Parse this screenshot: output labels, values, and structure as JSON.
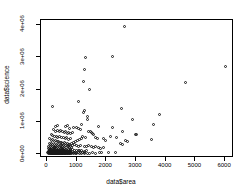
{
  "chart_data": {
    "type": "scatter",
    "title": "",
    "xlabel": "data$area",
    "ylabel": "data$science",
    "xlim": [
      -200,
      6300
    ],
    "ylim": [
      -120000,
      4150000
    ],
    "grid": false,
    "legend": null,
    "marker": "open-circle",
    "xticks": [
      0,
      1000,
      2000,
      3000,
      4000,
      5000,
      6000
    ],
    "xticklabels": [
      "0",
      "1000",
      "2000",
      "3000",
      "4000",
      "5000",
      "6000"
    ],
    "yticks": [
      0,
      1000000,
      2000000,
      3000000,
      4000000
    ],
    "yticklabels": [
      "0e+00",
      "1e+06",
      "2e+06",
      "3e+06",
      "4e+06"
    ],
    "n_points": 268,
    "points": [
      [
        2600,
        3950000
      ],
      [
        1300,
        3000000
      ],
      [
        2200,
        3020000
      ],
      [
        6000,
        2720000
      ],
      [
        1270,
        2620000
      ],
      [
        4680,
        2230000
      ],
      [
        1220,
        2240000
      ],
      [
        1450,
        2000000
      ],
      [
        1050,
        1620000
      ],
      [
        180,
        1470000
      ],
      [
        2520,
        1400000
      ],
      [
        3800,
        1220000
      ],
      [
        1280,
        1350000
      ],
      [
        1230,
        1300000
      ],
      [
        2890,
        1070000
      ],
      [
        1350,
        1150000
      ],
      [
        1360,
        1060000
      ],
      [
        3600,
        920000
      ],
      [
        1180,
        930000
      ],
      [
        1750,
        870000
      ],
      [
        300,
        860000
      ],
      [
        360,
        880000
      ],
      [
        620,
        840000
      ],
      [
        700,
        880000
      ],
      [
        2200,
        830000
      ],
      [
        760,
        800000
      ],
      [
        900,
        810000
      ],
      [
        980,
        830000
      ],
      [
        1050,
        790000
      ],
      [
        1120,
        760000
      ],
      [
        2540,
        700000
      ],
      [
        2990,
        610000
      ],
      [
        3020,
        620000
      ],
      [
        1400,
        700000
      ],
      [
        1460,
        690000
      ],
      [
        1500,
        670000
      ],
      [
        1540,
        640000
      ],
      [
        1580,
        600000
      ],
      [
        230,
        760000
      ],
      [
        280,
        700000
      ],
      [
        340,
        730000
      ],
      [
        420,
        700000
      ],
      [
        470,
        720000
      ],
      [
        520,
        690000
      ],
      [
        580,
        660000
      ],
      [
        640,
        690000
      ],
      [
        690,
        650000
      ],
      [
        740,
        670000
      ],
      [
        800,
        640000
      ],
      [
        850,
        660000
      ],
      [
        2130,
        560000
      ],
      [
        2340,
        520000
      ],
      [
        3530,
        440000
      ],
      [
        2650,
        430000
      ],
      [
        2720,
        400000
      ],
      [
        1900,
        470000
      ],
      [
        1980,
        430000
      ],
      [
        1700,
        480000
      ],
      [
        1620,
        500000
      ],
      [
        1300,
        520000
      ],
      [
        1210,
        540000
      ],
      [
        1150,
        480000
      ],
      [
        1080,
        450000
      ],
      [
        1020,
        410000
      ],
      [
        960,
        390000
      ],
      [
        890,
        360000
      ],
      [
        830,
        330000
      ],
      [
        770,
        300000
      ],
      [
        2470,
        330000
      ],
      [
        2560,
        300000
      ],
      [
        150,
        620000
      ],
      [
        200,
        580000
      ],
      [
        250,
        540000
      ],
      [
        310,
        560000
      ],
      [
        370,
        520000
      ],
      [
        430,
        540000
      ],
      [
        490,
        500000
      ],
      [
        550,
        520000
      ],
      [
        610,
        480000
      ],
      [
        670,
        500000
      ],
      [
        730,
        460000
      ],
      [
        790,
        470000
      ],
      [
        100,
        470000
      ],
      [
        140,
        430000
      ],
      [
        190,
        440000
      ],
      [
        240,
        400000
      ],
      [
        290,
        410000
      ],
      [
        340,
        380000
      ],
      [
        390,
        390000
      ],
      [
        440,
        360000
      ],
      [
        490,
        370000
      ],
      [
        540,
        340000
      ],
      [
        590,
        350000
      ],
      [
        640,
        320000
      ],
      [
        690,
        330000
      ],
      [
        740,
        300000
      ],
      [
        860,
        280000
      ],
      [
        920,
        300000
      ],
      [
        1000,
        270000
      ],
      [
        1070,
        250000
      ],
      [
        1140,
        280000
      ],
      [
        1250,
        250000
      ],
      [
        1330,
        230000
      ],
      [
        1410,
        260000
      ],
      [
        1490,
        230000
      ],
      [
        1570,
        200000
      ],
      [
        1650,
        230000
      ],
      [
        1730,
        200000
      ],
      [
        1810,
        180000
      ],
      [
        1890,
        210000
      ],
      [
        80,
        330000
      ],
      [
        120,
        300000
      ],
      [
        160,
        320000
      ],
      [
        200,
        290000
      ],
      [
        240,
        310000
      ],
      [
        280,
        280000
      ],
      [
        320,
        300000
      ],
      [
        360,
        270000
      ],
      [
        400,
        290000
      ],
      [
        440,
        260000
      ],
      [
        480,
        280000
      ],
      [
        520,
        250000
      ],
      [
        560,
        270000
      ],
      [
        600,
        240000
      ],
      [
        640,
        260000
      ],
      [
        680,
        230000
      ],
      [
        720,
        250000
      ],
      [
        760,
        220000
      ],
      [
        800,
        240000
      ],
      [
        840,
        210000
      ],
      [
        60,
        240000
      ],
      [
        90,
        220000
      ],
      [
        120,
        240000
      ],
      [
        150,
        210000
      ],
      [
        180,
        230000
      ],
      [
        210,
        200000
      ],
      [
        240,
        220000
      ],
      [
        270,
        190000
      ],
      [
        300,
        210000
      ],
      [
        330,
        180000
      ],
      [
        360,
        200000
      ],
      [
        390,
        170000
      ],
      [
        420,
        190000
      ],
      [
        450,
        160000
      ],
      [
        480,
        180000
      ],
      [
        510,
        150000
      ],
      [
        540,
        170000
      ],
      [
        570,
        140000
      ],
      [
        600,
        160000
      ],
      [
        630,
        130000
      ],
      [
        660,
        150000
      ],
      [
        690,
        120000
      ],
      [
        720,
        140000
      ],
      [
        750,
        120000
      ],
      [
        780,
        140000
      ],
      [
        810,
        110000
      ],
      [
        870,
        130000
      ],
      [
        930,
        110000
      ],
      [
        990,
        120000
      ],
      [
        1050,
        100000
      ],
      [
        1110,
        120000
      ],
      [
        1180,
        100000
      ],
      [
        1260,
        90000
      ],
      [
        1340,
        110000
      ],
      [
        50,
        160000
      ],
      [
        70,
        140000
      ],
      [
        90,
        155000
      ],
      [
        110,
        135000
      ],
      [
        130,
        150000
      ],
      [
        150,
        130000
      ],
      [
        170,
        145000
      ],
      [
        190,
        125000
      ],
      [
        210,
        140000
      ],
      [
        230,
        120000
      ],
      [
        250,
        135000
      ],
      [
        270,
        115000
      ],
      [
        290,
        130000
      ],
      [
        310,
        110000
      ],
      [
        330,
        125000
      ],
      [
        350,
        105000
      ],
      [
        370,
        120000
      ],
      [
        390,
        100000
      ],
      [
        410,
        115000
      ],
      [
        430,
        95000
      ],
      [
        450,
        110000
      ],
      [
        470,
        90000
      ],
      [
        490,
        105000
      ],
      [
        510,
        88000
      ],
      [
        530,
        100000
      ],
      [
        550,
        85000
      ],
      [
        570,
        98000
      ],
      [
        590,
        82000
      ],
      [
        610,
        95000
      ],
      [
        630,
        80000
      ],
      [
        650,
        92000
      ],
      [
        670,
        78000
      ],
      [
        690,
        90000
      ],
      [
        710,
        75000
      ],
      [
        730,
        88000
      ],
      [
        750,
        72000
      ],
      [
        770,
        85000
      ],
      [
        790,
        70000
      ],
      [
        40,
        95000
      ],
      [
        55,
        85000
      ],
      [
        70,
        92000
      ],
      [
        85,
        80000
      ],
      [
        100,
        88000
      ],
      [
        115,
        76000
      ],
      [
        130,
        85000
      ],
      [
        145,
        73000
      ],
      [
        160,
        82000
      ],
      [
        175,
        70000
      ],
      [
        190,
        80000
      ],
      [
        205,
        68000
      ],
      [
        220,
        78000
      ],
      [
        235,
        66000
      ],
      [
        250,
        76000
      ],
      [
        265,
        64000
      ],
      [
        280,
        74000
      ],
      [
        295,
        62000
      ],
      [
        310,
        72000
      ],
      [
        325,
        60000
      ],
      [
        340,
        70000
      ],
      [
        355,
        58000
      ],
      [
        370,
        68000
      ],
      [
        385,
        56000
      ],
      [
        400,
        66000
      ],
      [
        415,
        54000
      ],
      [
        430,
        64000
      ],
      [
        445,
        52000
      ],
      [
        460,
        62000
      ],
      [
        475,
        50000
      ],
      [
        490,
        60000
      ],
      [
        505,
        48000
      ],
      [
        520,
        58000
      ],
      [
        535,
        47000
      ],
      [
        550,
        56000
      ],
      [
        565,
        45000
      ],
      [
        580,
        55000
      ],
      [
        595,
        44000
      ],
      [
        610,
        53000
      ],
      [
        625,
        42000
      ],
      [
        640,
        52000
      ],
      [
        655,
        41000
      ],
      [
        670,
        50000
      ],
      [
        685,
        40000
      ],
      [
        700,
        48000
      ],
      [
        715,
        39000
      ],
      [
        730,
        47000
      ],
      [
        745,
        38000
      ],
      [
        760,
        45000
      ],
      [
        780,
        37000
      ],
      [
        830,
        55000
      ],
      [
        880,
        45000
      ],
      [
        940,
        60000
      ],
      [
        1000,
        42000
      ],
      [
        1060,
        55000
      ],
      [
        1130,
        40000
      ],
      [
        1200,
        50000
      ],
      [
        1280,
        38000
      ],
      [
        30,
        40000
      ],
      [
        45,
        32000
      ],
      [
        60,
        38000
      ],
      [
        75,
        30000
      ],
      [
        90,
        36000
      ],
      [
        105,
        28000
      ],
      [
        120,
        35000
      ],
      [
        135,
        27000
      ],
      [
        150,
        34000
      ],
      [
        165,
        26000
      ],
      [
        180,
        33000
      ],
      [
        195,
        25000
      ],
      [
        210,
        32000
      ],
      [
        225,
        24000
      ],
      [
        240,
        31000
      ],
      [
        255,
        23000
      ],
      [
        270,
        30000
      ],
      [
        285,
        22000
      ],
      [
        300,
        29000
      ],
      [
        315,
        21000
      ],
      [
        330,
        28000
      ],
      [
        345,
        20000
      ],
      [
        360,
        27000
      ],
      [
        375,
        19000
      ],
      [
        390,
        26000
      ],
      [
        405,
        18000
      ],
      [
        420,
        25000
      ],
      [
        435,
        17000
      ],
      [
        450,
        24000
      ],
      [
        465,
        16000
      ],
      [
        480,
        23000
      ],
      [
        495,
        15000
      ],
      [
        510,
        22000
      ],
      [
        525,
        14000
      ],
      [
        540,
        21000
      ],
      [
        560,
        13000
      ],
      [
        580,
        20000
      ],
      [
        600,
        12000
      ],
      [
        620,
        19000
      ],
      [
        640,
        11000
      ],
      [
        660,
        18000
      ],
      [
        680,
        10000
      ],
      [
        700,
        17000
      ],
      [
        720,
        9000
      ],
      [
        745,
        16000
      ],
      [
        770,
        8000
      ],
      [
        800,
        15000
      ],
      [
        840,
        20000
      ],
      [
        890,
        14000
      ],
      [
        950,
        25000
      ],
      [
        1010,
        18000
      ],
      [
        1090,
        30000
      ],
      [
        1170,
        22000
      ],
      [
        1260,
        15000
      ],
      [
        1350,
        28000
      ],
      [
        1440,
        20000
      ],
      [
        1530,
        35000
      ],
      [
        1640,
        25000
      ],
      [
        1760,
        55000
      ],
      [
        1850,
        40000
      ],
      [
        2080,
        38000
      ],
      [
        2300,
        45000
      ]
    ]
  }
}
